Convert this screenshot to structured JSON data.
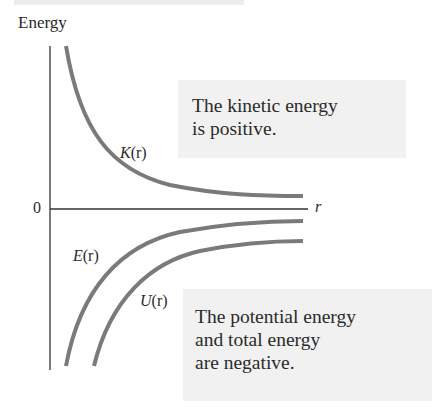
{
  "diagram": {
    "y_axis_label": "Energy",
    "x_axis_label": "r",
    "origin_label": "0",
    "curves": [
      {
        "id": "K",
        "label_name": "K",
        "label_arg": "(r)",
        "description": "kinetic energy, positive, decays toward 0",
        "color": "#7a7a7a"
      },
      {
        "id": "E",
        "label_name": "E",
        "label_arg": "(r)",
        "description": "total energy, negative, rises toward 0",
        "color": "#7a7a7a"
      },
      {
        "id": "U",
        "label_name": "U",
        "label_arg": "(r)",
        "description": "potential energy, negative, rises toward 0 below E",
        "color": "#7a7a7a"
      }
    ],
    "annotations": {
      "top": {
        "lines": [
          "The kinetic energy",
          "is positive."
        ]
      },
      "bottom": {
        "lines": [
          "The potential energy",
          "and total energy",
          "are negative."
        ]
      }
    },
    "colors": {
      "axis": "#333333",
      "curve": "#7a7a7a",
      "box_background": "#f1f1f1",
      "text": "#2a2a2a"
    }
  }
}
